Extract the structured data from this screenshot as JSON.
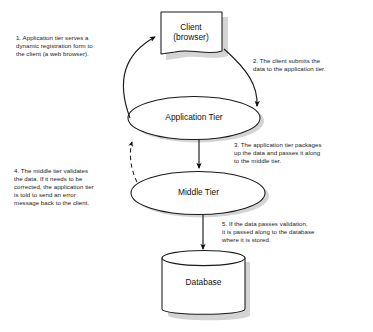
{
  "diagram": {
    "background_color": "#ffffff",
    "stroke_color": "#1a1a1a",
    "shadow_color": "#9a9a9a",
    "nodes": {
      "client": {
        "label": "Client\n(browser)",
        "shape": "document-box"
      },
      "application_tier": {
        "label": "Application Tier",
        "shape": "ellipse"
      },
      "middle_tier": {
        "label": "Middle Tier",
        "shape": "ellipse"
      },
      "database": {
        "label": "Database",
        "shape": "cylinder"
      }
    },
    "notes": [
      {
        "id": "note-1",
        "step": "1",
        "text": "1. Application tier serves a\ndynamic registration form to\nthe client (a web browser)."
      },
      {
        "id": "note-2",
        "step": "2",
        "text": "2. The client submits the\ndata to the application tier."
      },
      {
        "id": "note-3",
        "step": "3",
        "text": "3. The application tier packages\nup the data and passes it along\nto the middle tier."
      },
      {
        "id": "note-4",
        "step": "4",
        "text": "4. The middle tier validates\nthe data. If it needs to be\ncorrected, the application tier\nis told to send an error\nmessage back to the client."
      },
      {
        "id": "note-5",
        "step": "5",
        "text": "5. If the data passes validation,\nit is passed along to the database\nwhere it is stored."
      }
    ],
    "connectors": [
      {
        "name": "app-tier-to-client",
        "style": "solid-curve",
        "from": "application_tier",
        "to": "client"
      },
      {
        "name": "client-to-app-tier",
        "style": "solid-curve",
        "from": "client",
        "to": "application_tier"
      },
      {
        "name": "app-tier-to-middle-tier",
        "style": "solid-straight",
        "from": "application_tier",
        "to": "middle_tier"
      },
      {
        "name": "middle-tier-to-app-tier",
        "style": "dashed-curve",
        "from": "middle_tier",
        "to": "application_tier"
      },
      {
        "name": "middle-tier-to-database",
        "style": "solid-straight",
        "from": "middle_tier",
        "to": "database"
      }
    ]
  }
}
